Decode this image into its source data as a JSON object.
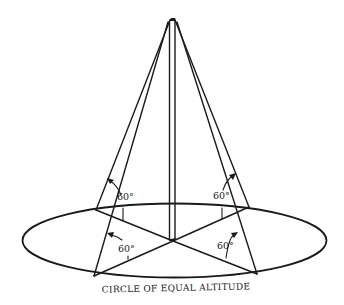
{
  "diagram": {
    "caption": "CIRCLE OF EQUAL ALTITUDE",
    "angle_labels": {
      "back_left": "60°",
      "back_right": "60°",
      "front_left": "60°",
      "front_right": "60°"
    },
    "elements": [
      "vertical pole",
      "four guy lines from pole top to ground points",
      "elliptical circle on ground (perspective)",
      "four radial lines from pole base to ground points",
      "four 60° angle arcs with arrows"
    ],
    "colors": {
      "ink": "#1a1a1a",
      "background": "#ffffff"
    }
  }
}
